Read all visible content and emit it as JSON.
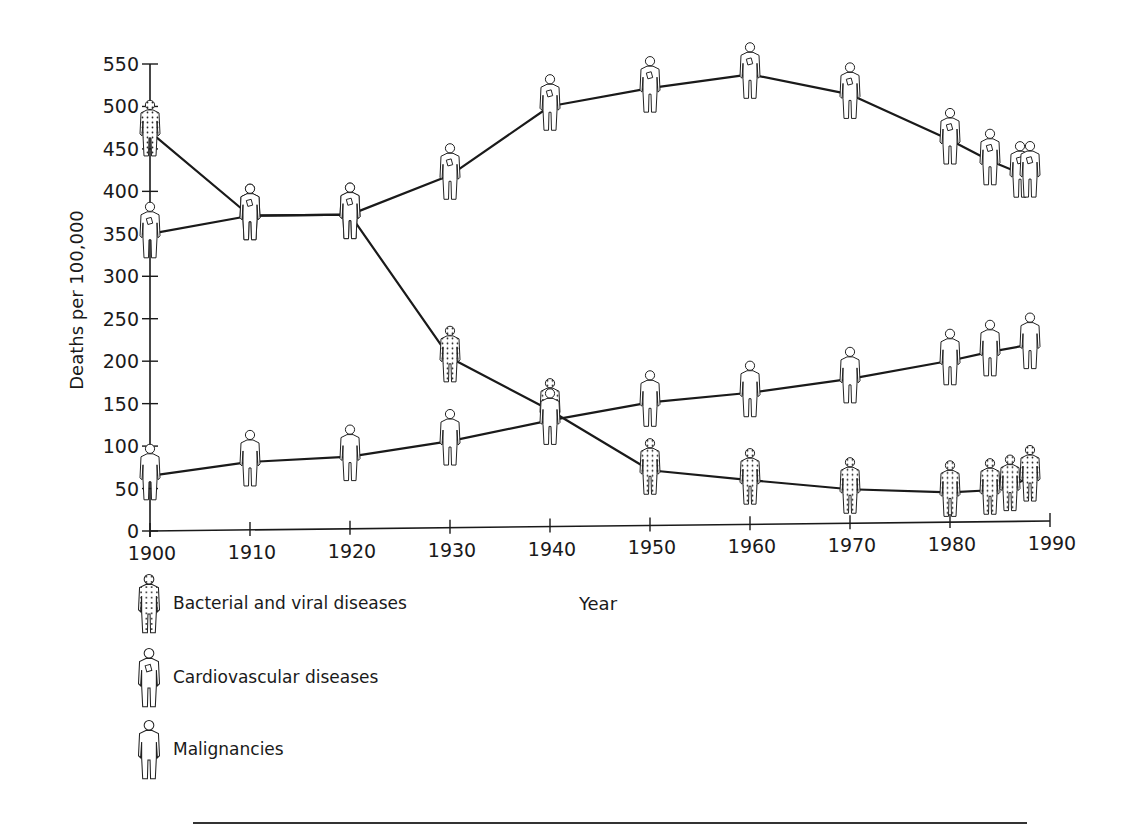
{
  "chart_data": {
    "type": "line",
    "title": "",
    "xlabel": "Year",
    "ylabel": "Deaths per 100,000",
    "xlim": [
      1900,
      1990
    ],
    "ylim": [
      0,
      550
    ],
    "x_ticks": [
      1900,
      1910,
      1920,
      1930,
      1940,
      1950,
      1960,
      1970,
      1980,
      1990
    ],
    "y_ticks": [
      0,
      50,
      100,
      150,
      200,
      250,
      300,
      350,
      400,
      450,
      500,
      550
    ],
    "grid": false,
    "legend_position": "bottom-left",
    "series": [
      {
        "name": "Bacterial and viral diseases",
        "icon": "dotted-person-icon",
        "x": [
          1900,
          1910,
          1920,
          1930,
          1940,
          1950,
          1960,
          1970,
          1980,
          1984,
          1986,
          1988
        ],
        "values": [
          470,
          370,
          370,
          200,
          137,
          65,
          52,
          40,
          35,
          37,
          41,
          52
        ]
      },
      {
        "name": "Cardiovascular diseases",
        "icon": "heart-person-icon",
        "x": [
          1900,
          1910,
          1920,
          1930,
          1940,
          1950,
          1960,
          1970,
          1980,
          1984,
          1987,
          1988
        ],
        "values": [
          350,
          370,
          370,
          415,
          495,
          515,
          530,
          505,
          450,
          425,
          410,
          410
        ]
      },
      {
        "name": "Malignancies",
        "icon": "plain-person-icon",
        "x": [
          1900,
          1910,
          1920,
          1930,
          1940,
          1950,
          1960,
          1970,
          1980,
          1984,
          1988
        ],
        "values": [
          65,
          80,
          85,
          102,
          125,
          145,
          155,
          170,
          190,
          200,
          208
        ]
      }
    ]
  },
  "legend": {
    "items": [
      {
        "label": "Bacterial and viral diseases",
        "icon": "dotted-person-icon"
      },
      {
        "label": "Cardiovascular diseases",
        "icon": "heart-person-icon"
      },
      {
        "label": "Malignancies",
        "icon": "plain-person-icon"
      }
    ]
  },
  "axes": {
    "x_title": "Year",
    "y_title": "Deaths per 100,000"
  },
  "colors": {
    "line": "#1a1a1a",
    "axis": "#1a1a1a",
    "background": "#ffffff"
  }
}
